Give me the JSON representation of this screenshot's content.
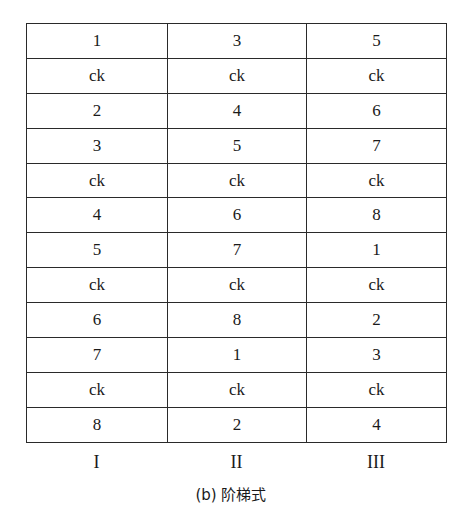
{
  "table": {
    "rows": [
      [
        "1",
        "3",
        "5"
      ],
      [
        "ck",
        "ck",
        "ck"
      ],
      [
        "2",
        "4",
        "6"
      ],
      [
        "3",
        "5",
        "7"
      ],
      [
        "ck",
        "ck",
        "ck"
      ],
      [
        "4",
        "6",
        "8"
      ],
      [
        "5",
        "7",
        "1"
      ],
      [
        "ck",
        "ck",
        "ck"
      ],
      [
        "6",
        "8",
        "2"
      ],
      [
        "7",
        "1",
        "3"
      ],
      [
        "ck",
        "ck",
        "ck"
      ],
      [
        "8",
        "2",
        "4"
      ]
    ],
    "column_labels": [
      "I",
      "II",
      "III"
    ]
  },
  "caption": "(b) 阶梯式"
}
